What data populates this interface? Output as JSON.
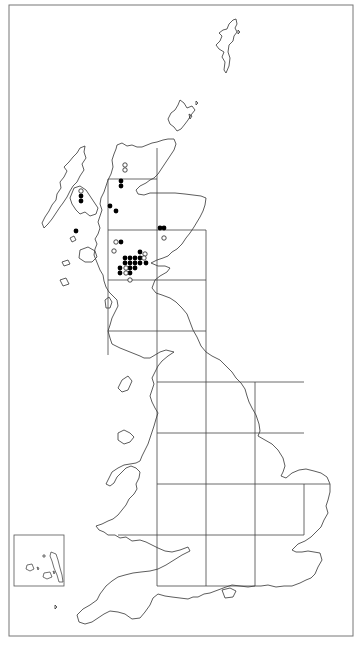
{
  "map": {
    "type": "distribution-map",
    "region": "Great Britain",
    "colors": {
      "line": "#333333",
      "grid": "#444444",
      "frame": "#777777",
      "dot": "#000000",
      "background": "#ffffff"
    },
    "frame": {
      "x": 9,
      "y": 5,
      "w": 344,
      "h": 631
    },
    "grid": {
      "cell": 50,
      "segments": [
        [
          108,
          179,
          157,
          179
        ],
        [
          108,
          179,
          108,
          331
        ],
        [
          157,
          179,
          157,
          586
        ],
        [
          108,
          230,
          206,
          230
        ],
        [
          206,
          230,
          206,
          280
        ],
        [
          108,
          280,
          206,
          280
        ],
        [
          108,
          331,
          206,
          331
        ],
        [
          157,
          148,
          157,
          179
        ],
        [
          157,
          382,
          304,
          382
        ],
        [
          157,
          433,
          304,
          433
        ],
        [
          206,
          280,
          206,
          586
        ],
        [
          255,
          382,
          255,
          586
        ],
        [
          304,
          484,
          304,
          535
        ],
        [
          157,
          484,
          330,
          484
        ],
        [
          118,
          535,
          304,
          535
        ],
        [
          157,
          586,
          255,
          586
        ],
        [
          108,
          331,
          108,
          355
        ]
      ]
    },
    "inset": {
      "x": 14,
      "y": 535,
      "w": 50,
      "h": 51,
      "label": "Channel Islands"
    },
    "legend": {
      "filled": "recent records",
      "open": "older records"
    },
    "records": {
      "filled": [
        [
          121,
          181
        ],
        [
          121,
          186
        ],
        [
          81,
          196
        ],
        [
          81,
          201
        ],
        [
          110,
          206
        ],
        [
          116,
          211
        ],
        [
          76,
          231
        ],
        [
          160,
          228
        ],
        [
          164,
          228
        ],
        [
          121,
          242
        ],
        [
          140,
          252
        ],
        [
          125,
          258
        ],
        [
          130,
          258
        ],
        [
          135,
          258
        ],
        [
          140,
          258
        ],
        [
          125,
          263
        ],
        [
          130,
          263
        ],
        [
          135,
          263
        ],
        [
          140,
          263
        ],
        [
          146,
          263
        ],
        [
          120,
          268
        ],
        [
          130,
          268
        ],
        [
          135,
          268
        ],
        [
          120,
          273
        ],
        [
          130,
          273
        ]
      ],
      "open": [
        [
          125,
          165
        ],
        [
          125,
          170
        ],
        [
          81,
          191
        ],
        [
          164,
          238
        ],
        [
          116,
          242
        ],
        [
          114,
          251
        ],
        [
          145,
          254
        ],
        [
          144,
          258
        ],
        [
          126,
          268
        ],
        [
          126,
          273
        ],
        [
          130,
          280
        ]
      ]
    }
  }
}
